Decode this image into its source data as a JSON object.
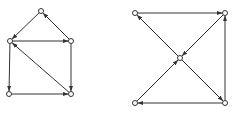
{
  "diagram": {
    "stroke_color": "#333333",
    "node_fill": "#ffffff",
    "node_radius": 2.5,
    "graphs": [
      {
        "name": "left-graph",
        "nodes": [
          {
            "id": "a",
            "x": 41,
            "y": 11
          },
          {
            "id": "b",
            "x": 10,
            "y": 41
          },
          {
            "id": "c",
            "x": 71,
            "y": 41
          },
          {
            "id": "d",
            "x": 9,
            "y": 94
          },
          {
            "id": "e",
            "x": 71,
            "y": 94
          }
        ],
        "edges": [
          {
            "from": "a",
            "to": "b"
          },
          {
            "from": "c",
            "to": "a"
          },
          {
            "from": "b",
            "to": "c"
          },
          {
            "from": "b",
            "to": "d"
          },
          {
            "from": "c",
            "to": "e"
          },
          {
            "from": "d",
            "to": "e"
          },
          {
            "from": "e",
            "to": "b"
          }
        ]
      },
      {
        "name": "right-graph",
        "nodes": [
          {
            "id": "p",
            "x": 135,
            "y": 13
          },
          {
            "id": "q",
            "x": 225,
            "y": 13
          },
          {
            "id": "m",
            "x": 180,
            "y": 58
          },
          {
            "id": "r",
            "x": 135,
            "y": 103
          },
          {
            "id": "s",
            "x": 225,
            "y": 103
          }
        ],
        "edges": [
          {
            "from": "p",
            "to": "q"
          },
          {
            "from": "q",
            "to": "m"
          },
          {
            "from": "m",
            "to": "p"
          },
          {
            "from": "r",
            "to": "m"
          },
          {
            "from": "m",
            "to": "s"
          },
          {
            "from": "s",
            "to": "r"
          },
          {
            "from": "s",
            "to": "q"
          }
        ]
      }
    ]
  }
}
